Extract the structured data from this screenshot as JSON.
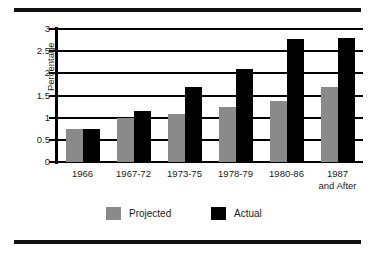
{
  "chart_data": {
    "type": "bar",
    "title": "",
    "xlabel": "",
    "ylabel": "Percentage",
    "ylim": [
      0,
      3
    ],
    "yticks": [
      "0",
      "0.5",
      "1",
      "1.5",
      "2",
      "2.5",
      "3"
    ],
    "grid": true,
    "legend_position": "bottom",
    "categories": [
      "1966",
      "1967-72",
      "1973-75",
      "1978-79",
      "1980-86",
      "1987\nand After"
    ],
    "series": [
      {
        "name": "Projected",
        "color": "#8a8a8a",
        "values": [
          0.75,
          1.0,
          1.08,
          1.23,
          1.38,
          1.7
        ]
      },
      {
        "name": "Actual",
        "color": "#000000",
        "values": [
          0.75,
          1.15,
          1.7,
          2.1,
          2.78,
          2.8
        ]
      }
    ]
  },
  "legend": {
    "items": [
      {
        "label": "Projected",
        "swatch": "projected-swatch"
      },
      {
        "label": "Actual",
        "swatch": "actual-swatch"
      }
    ]
  },
  "colors": {
    "projected": "#8a8a8a",
    "actual": "#000000",
    "rule": "#111111",
    "axis": "#000000",
    "background": "#ffffff"
  }
}
